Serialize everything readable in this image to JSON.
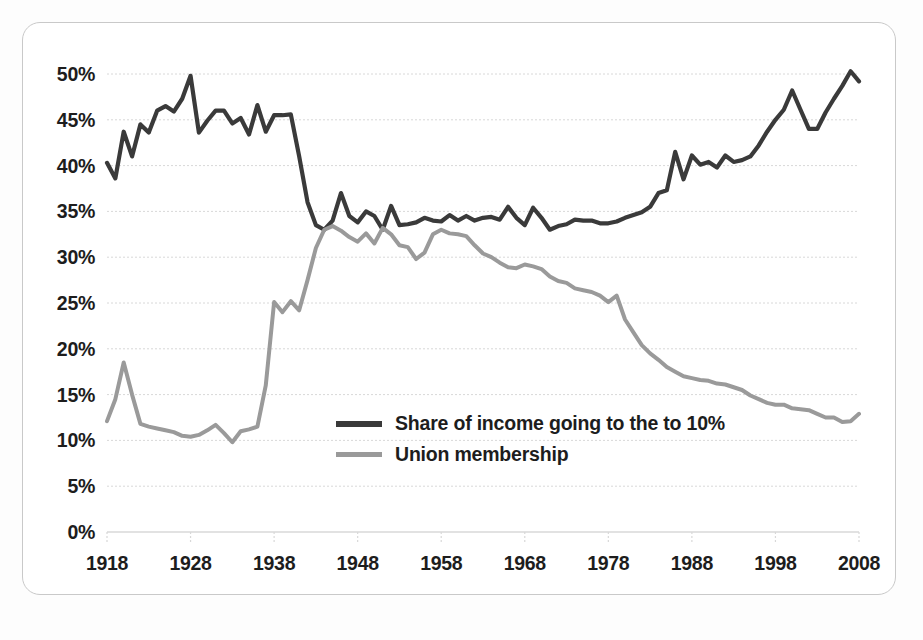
{
  "chart_data": {
    "type": "line",
    "title": "",
    "subtitle": "",
    "xlabel": "",
    "ylabel": "",
    "xlim": [
      1918,
      2008
    ],
    "ylim": [
      0,
      50
    ],
    "grid": true,
    "legend_position": "center-left",
    "y_ticks": [
      "0%",
      "5%",
      "10%",
      "15%",
      "20%",
      "25%",
      "30%",
      "35%",
      "40%",
      "45%",
      "50%"
    ],
    "y_tick_values": [
      0,
      5,
      10,
      15,
      20,
      25,
      30,
      35,
      40,
      45,
      50
    ],
    "x_ticks": [
      "1918",
      "1928",
      "1938",
      "1948",
      "1958",
      "1968",
      "1978",
      "1988",
      "1998",
      "2008"
    ],
    "x_tick_values": [
      1918,
      1928,
      1938,
      1948,
      1958,
      1968,
      1978,
      1988,
      1998,
      2008
    ],
    "colors": {
      "income_share": "#3a3a3a",
      "union_membership": "#9a9a9a",
      "grid": "#d8d8d8",
      "axis_text": "#1d1d1d",
      "frame": "#c9c9c9"
    },
    "x": [
      1918,
      1919,
      1920,
      1921,
      1922,
      1923,
      1924,
      1925,
      1926,
      1927,
      1928,
      1929,
      1930,
      1931,
      1932,
      1933,
      1934,
      1935,
      1936,
      1937,
      1938,
      1939,
      1940,
      1941,
      1942,
      1943,
      1944,
      1945,
      1946,
      1947,
      1948,
      1949,
      1950,
      1951,
      1952,
      1953,
      1954,
      1955,
      1956,
      1957,
      1958,
      1959,
      1960,
      1961,
      1962,
      1963,
      1964,
      1965,
      1966,
      1967,
      1968,
      1969,
      1970,
      1971,
      1972,
      1973,
      1974,
      1975,
      1976,
      1977,
      1978,
      1979,
      1980,
      1981,
      1982,
      1983,
      1984,
      1985,
      1986,
      1987,
      1988,
      1989,
      1990,
      1991,
      1992,
      1993,
      1994,
      1995,
      1996,
      1997,
      1998,
      1999,
      2000,
      2001,
      2002,
      2003,
      2004,
      2005,
      2006,
      2007,
      2008
    ],
    "series": [
      {
        "name": "Share of income going to the to 10%",
        "color": "#3a3a3a",
        "values": [
          40.3,
          38.6,
          43.7,
          41.0,
          44.5,
          43.6,
          46.0,
          46.5,
          45.9,
          47.3,
          49.8,
          43.6,
          44.9,
          46.0,
          46.0,
          44.6,
          45.2,
          43.4,
          46.6,
          43.7,
          45.5,
          45.5,
          45.6,
          41.0,
          36.0,
          33.5,
          33.0,
          34.0,
          37.0,
          34.5,
          33.8,
          35.0,
          34.5,
          33.0,
          35.6,
          33.5,
          33.6,
          33.8,
          34.3,
          34.0,
          33.9,
          34.6,
          34.0,
          34.5,
          34.0,
          34.3,
          34.4,
          34.1,
          35.5,
          34.3,
          33.5,
          35.4,
          34.3,
          33.0,
          33.4,
          33.6,
          34.1,
          34.0,
          34.0,
          33.7,
          33.7,
          33.9,
          34.3,
          34.6,
          34.9,
          35.5,
          37.0,
          37.3,
          41.5,
          38.5,
          41.1,
          40.1,
          40.4,
          39.8,
          41.1,
          40.4,
          40.6,
          41.0,
          42.2,
          43.7,
          45.0,
          46.1,
          48.2,
          46.1,
          44.0,
          44.0,
          45.8,
          47.3,
          48.7,
          50.3,
          49.2
        ]
      },
      {
        "name": "Union membership",
        "color": "#9a9a9a",
        "values": [
          12.1,
          14.5,
          18.5,
          15.0,
          11.8,
          11.5,
          11.3,
          11.1,
          10.9,
          10.5,
          10.4,
          10.6,
          11.1,
          11.7,
          10.8,
          9.8,
          11.0,
          11.2,
          11.5,
          16.0,
          25.1,
          24.0,
          25.2,
          24.2,
          27.5,
          31.0,
          33.0,
          33.4,
          32.9,
          32.2,
          31.7,
          32.6,
          31.5,
          33.2,
          32.5,
          31.3,
          31.1,
          29.8,
          30.5,
          32.5,
          33.0,
          32.6,
          32.5,
          32.3,
          31.3,
          30.4,
          30.0,
          29.4,
          28.9,
          28.8,
          29.2,
          29.0,
          28.7,
          27.9,
          27.4,
          27.2,
          26.6,
          26.4,
          26.2,
          25.8,
          25.1,
          25.8,
          23.2,
          21.8,
          20.4,
          19.5,
          18.8,
          18.0,
          17.5,
          17.0,
          16.8,
          16.6,
          16.5,
          16.2,
          16.1,
          15.8,
          15.5,
          14.9,
          14.5,
          14.1,
          13.9,
          13.9,
          13.5,
          13.4,
          13.3,
          12.9,
          12.5,
          12.5,
          12.0,
          12.1,
          12.9
        ]
      }
    ]
  }
}
